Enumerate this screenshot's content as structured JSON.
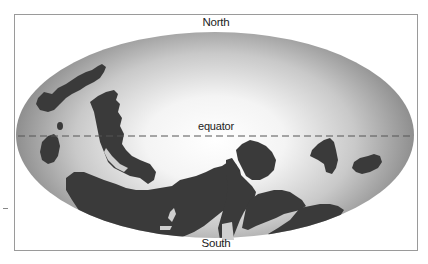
{
  "figure": {
    "type": "paleogeographic-map",
    "projection": "elliptical (Mollweide-like)",
    "labels": {
      "north": "North",
      "south": "South",
      "equator": "equator"
    },
    "colors": {
      "frame_border": "#9a9a9a",
      "ocean_center": "#ffffff",
      "ocean_edge": "#8c8c8c",
      "landmass": "#3a3a3a",
      "equator_line": "#555555"
    },
    "equator_style": "dashed"
  }
}
